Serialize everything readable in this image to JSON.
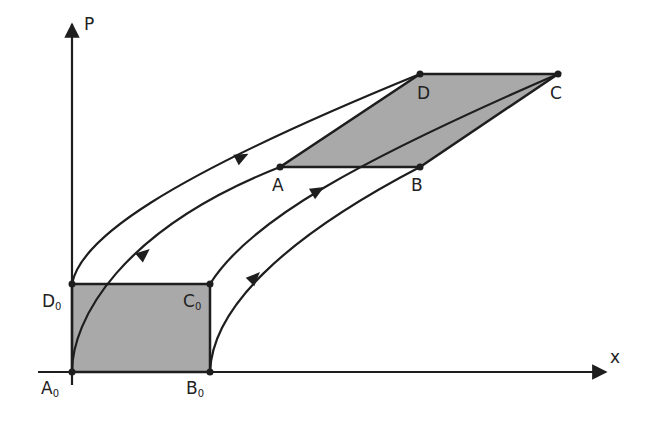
{
  "diagram": {
    "axes": {
      "x_label": "x",
      "y_label": "P"
    },
    "initial_region": {
      "shape": "rectangle",
      "vertices": [
        {
          "name": "A",
          "sub": "0"
        },
        {
          "name": "B",
          "sub": "0"
        },
        {
          "name": "C",
          "sub": "0"
        },
        {
          "name": "D",
          "sub": "0"
        }
      ]
    },
    "evolved_region": {
      "shape": "parallelogram",
      "vertices": [
        {
          "name": "A"
        },
        {
          "name": "B"
        },
        {
          "name": "C"
        },
        {
          "name": "D"
        }
      ]
    },
    "trajectories": [
      {
        "from": "D0",
        "to": "D"
      },
      {
        "from": "A0",
        "to": "A"
      },
      {
        "from": "C0",
        "to": "C"
      },
      {
        "from": "B0",
        "to": "B"
      }
    ],
    "colors": {
      "line": "#1e1e1e",
      "fill": "#a9a9a9",
      "background": "#ffffff"
    }
  }
}
